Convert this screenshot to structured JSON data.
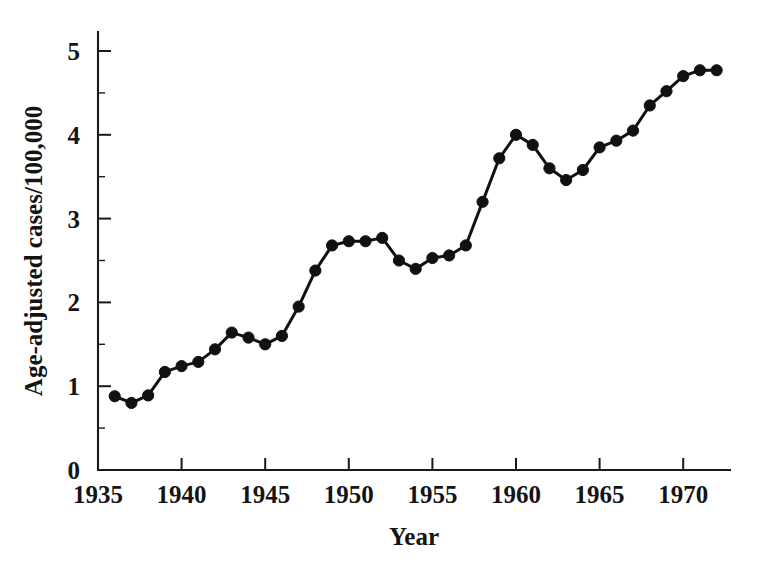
{
  "chart_data": {
    "type": "line",
    "title": "",
    "xlabel": "Year",
    "ylabel": "Age-adjusted cases/100,000",
    "xlim": [
      1935,
      1973
    ],
    "ylim": [
      0,
      5.25
    ],
    "grid": false,
    "legend": "none",
    "marker": "filled-circle",
    "line_color": "#111111",
    "marker_color": "#111111",
    "background_color": "#ffffff",
    "x_tick_labels": [
      "1935",
      "1940",
      "1945",
      "1950",
      "1955",
      "1960",
      "1965",
      "1970"
    ],
    "x_ticks": [
      1935,
      1940,
      1945,
      1950,
      1955,
      1960,
      1965,
      1970
    ],
    "y_tick_labels": [
      "0",
      "1",
      "2",
      "3",
      "4",
      "5"
    ],
    "y_ticks": [
      0,
      1,
      2,
      3,
      4,
      5
    ],
    "y_minor_ticks": [
      0.5,
      1.5,
      2.5,
      3.5,
      4.5,
      5.0
    ],
    "x": [
      1936,
      1937,
      1938,
      1939,
      1940,
      1941,
      1942,
      1943,
      1944,
      1945,
      1946,
      1947,
      1948,
      1949,
      1950,
      1951,
      1952,
      1953,
      1954,
      1955,
      1956,
      1957,
      1958,
      1959,
      1960,
      1961,
      1962,
      1963,
      1964,
      1965,
      1966,
      1967,
      1968,
      1969,
      1970,
      1971,
      1972
    ],
    "values": [
      0.88,
      0.8,
      0.89,
      1.17,
      1.24,
      1.29,
      1.44,
      1.64,
      1.58,
      1.5,
      1.6,
      1.95,
      2.38,
      2.68,
      2.73,
      2.73,
      2.77,
      2.5,
      2.4,
      2.53,
      2.56,
      2.68,
      3.2,
      3.72,
      4.0,
      3.88,
      3.6,
      3.46,
      3.58,
      3.85,
      3.93,
      4.05,
      4.35,
      4.52,
      4.7,
      4.77,
      4.77
    ],
    "series": [
      {
        "name": "Age-adjusted cases/100,000",
        "values": [
          0.88,
          0.8,
          0.89,
          1.17,
          1.24,
          1.29,
          1.44,
          1.64,
          1.58,
          1.5,
          1.6,
          1.95,
          2.38,
          2.68,
          2.73,
          2.73,
          2.77,
          2.5,
          2.4,
          2.53,
          2.56,
          2.68,
          3.2,
          3.72,
          4.0,
          3.88,
          3.6,
          3.46,
          3.58,
          3.85,
          3.93,
          4.05,
          4.35,
          4.52,
          4.7,
          4.77,
          4.77
        ]
      }
    ]
  }
}
